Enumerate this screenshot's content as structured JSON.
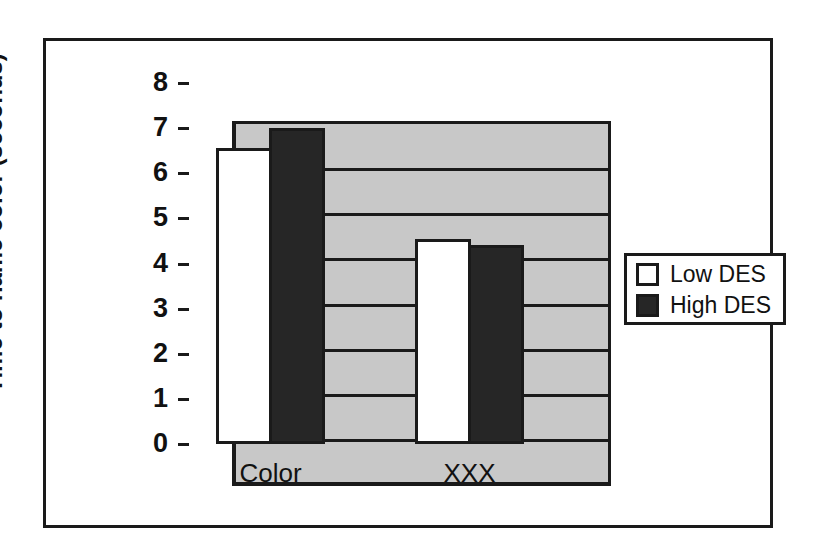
{
  "chart_data": {
    "type": "bar",
    "title": "",
    "xlabel": "",
    "ylabel": "Time to name color (seconds)",
    "categories": [
      "Color",
      "XXX"
    ],
    "series": [
      {
        "name": "Low DES",
        "values": [
          6.55,
          4.55
        ],
        "color": "#ffffff"
      },
      {
        "name": "High DES",
        "values": [
          7.0,
          4.4
        ],
        "color": "#262626"
      }
    ],
    "ylim": [
      0,
      8
    ],
    "yticks": [
      0,
      1,
      2,
      3,
      4,
      5,
      6,
      7,
      8
    ],
    "ytick_labels": [
      "0",
      "1",
      "2",
      "3",
      "4",
      "5",
      "6",
      "7",
      "8"
    ],
    "grid": true,
    "legend_position": "right",
    "plot_background": "#c8c8c8",
    "axis_color": "#1a1a1a"
  },
  "legend": {
    "entries": [
      {
        "label": "Low DES",
        "swatch": "white-square-swatch"
      },
      {
        "label": "High DES",
        "swatch": "black-square-swatch"
      }
    ]
  }
}
